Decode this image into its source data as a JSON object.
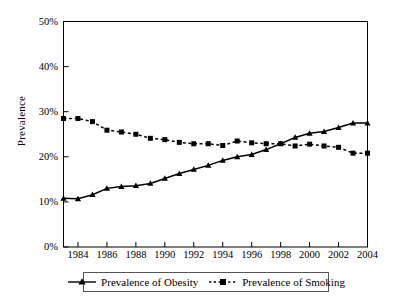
{
  "chart_data": {
    "type": "line",
    "title": "",
    "xlabel": "",
    "ylabel": "Prevalence",
    "xlim": [
      1983,
      2004
    ],
    "ylim": [
      0,
      50
    ],
    "y_unit": "%",
    "grid": false,
    "legend_position": "bottom",
    "x": [
      1983,
      1984,
      1985,
      1986,
      1987,
      1988,
      1989,
      1990,
      1991,
      1992,
      1993,
      1994,
      1995,
      1996,
      1997,
      1998,
      1999,
      2000,
      2001,
      2002,
      2003,
      2004
    ],
    "xticklabels": [
      "1984",
      "1986",
      "1988",
      "1990",
      "1992",
      "1994",
      "1996",
      "1998",
      "2000",
      "2002",
      "2004"
    ],
    "xtickvalues": [
      1984,
      1986,
      1988,
      1990,
      1992,
      1994,
      1996,
      1998,
      2000,
      2002,
      2004
    ],
    "yticklabels": [
      "0%",
      "10%",
      "20%",
      "30%",
      "40%",
      "50%"
    ],
    "ytickvalues": [
      0,
      10,
      20,
      30,
      40,
      50
    ],
    "series": [
      {
        "name": "Prevalence of Obesity",
        "marker": "triangle",
        "linestyle": "solid",
        "color": "#000000",
        "values": [
          10.8,
          10.7,
          11.6,
          13.0,
          13.4,
          13.6,
          14.1,
          15.2,
          16.3,
          17.2,
          18.1,
          19.2,
          20.0,
          20.5,
          21.6,
          22.9,
          24.3,
          25.2,
          25.6,
          26.5,
          27.5,
          27.5
        ]
      },
      {
        "name": "Prevalence of Smoking",
        "marker": "square",
        "linestyle": "dashed",
        "color": "#000000",
        "values": [
          28.5,
          28.5,
          27.8,
          25.9,
          25.5,
          25.0,
          24.1,
          23.8,
          23.2,
          22.9,
          22.9,
          22.5,
          23.5,
          23.1,
          22.9,
          22.9,
          22.4,
          22.8,
          22.4,
          22.1,
          20.8,
          20.8
        ]
      }
    ]
  },
  "legend": {
    "items": [
      {
        "label": "Prevalence of Obesity",
        "marker": "triangle-marker",
        "style": "solid"
      },
      {
        "label": "Prevalence of Smoking",
        "marker": "square-marker",
        "style": "dashed"
      }
    ]
  },
  "axis": {
    "y_title": "Prevalence"
  }
}
